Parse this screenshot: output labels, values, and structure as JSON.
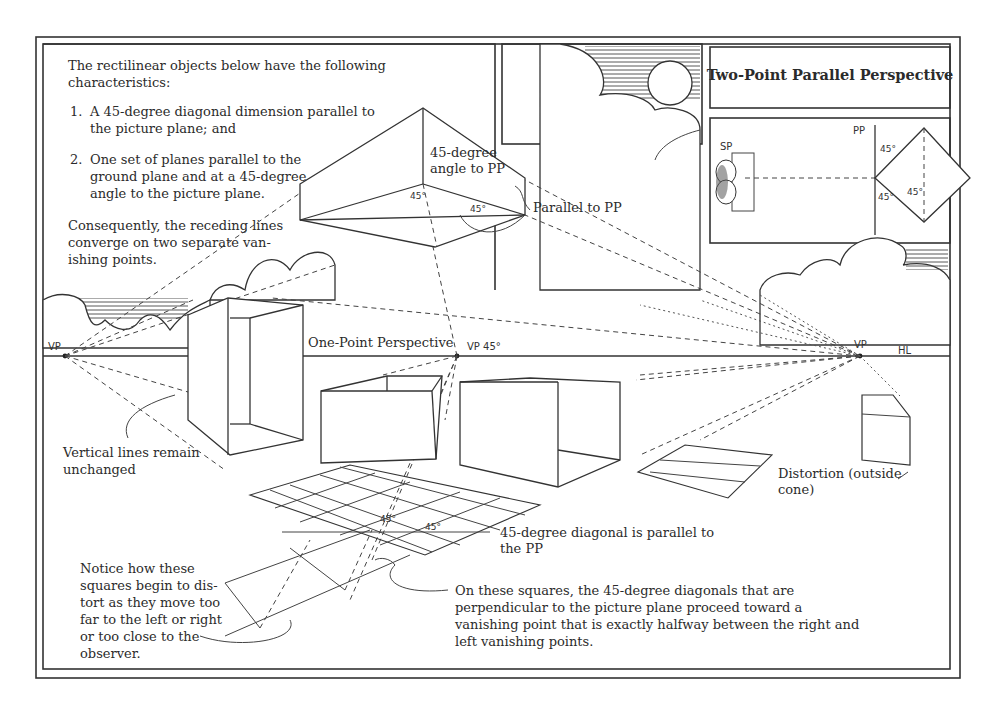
{
  "title": "Two-Point Parallel Perspective",
  "intro": {
    "lines": [
      "The rectilinear objects below have the following",
      "characteristics:"
    ]
  },
  "characteristics": [
    {
      "number": "1.",
      "lines": [
        "A 45-degree diagonal dimension parallel to",
        "the picture plane; and"
      ]
    },
    {
      "number": "2.",
      "lines": [
        "One set of planes parallel to the",
        "ground plane and  at a 45-degree",
        "angle to the picture plane."
      ]
    }
  ],
  "consequence": {
    "lines": [
      "Consequently, the receding lines",
      "converge on two separate van-",
      "ishing points."
    ]
  },
  "labels": {
    "angle_to_pp": [
      "45-degree",
      "angle to PP"
    ],
    "parallel_to_pp": "Parallel to PP",
    "one_point": "One-Point Perspective",
    "vp_left": "VP",
    "vp_45": "VP 45°",
    "vp_right": "VP",
    "hl": "HL",
    "vertical_lines": [
      "Vertical lines remain",
      "unchanged"
    ],
    "distortion": [
      "Distortion (outside",
      "cone)"
    ],
    "diagonal_parallel": [
      "45-degree diagonal is parallel to",
      "the PP"
    ],
    "notice": [
      "Notice how these",
      "squares begin to dis-",
      "tort as they move too",
      "far to the left or right",
      "or too close to the",
      "observer."
    ],
    "on_these_squares": [
      "On these squares, the 45-degree diagonals that are",
      "perpendicular to the picture plane proceed toward a",
      "vanishing point that is exactly halfway between the right and",
      "left vanishing points."
    ],
    "angle_45": "45°",
    "plan_sp": "SP",
    "plan_pp": "PP",
    "plan_45_top": "45°",
    "plan_45_bottom": "45°",
    "plan_45_inner": "45°"
  }
}
